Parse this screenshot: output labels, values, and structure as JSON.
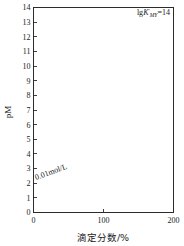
{
  "figure": {
    "name": "complexometric-titration-curves",
    "background_color": "#ffffff",
    "line_color": "#2b2b2b"
  },
  "axes": {
    "y_title": "pM",
    "x_title": "滴定分数/%",
    "y_ticks": [
      "0",
      "1",
      "2",
      "3",
      "4",
      "5",
      "6",
      "7",
      "8",
      "9",
      "10",
      "11",
      "12",
      "13",
      "14"
    ],
    "x_ticks": [
      "0",
      "100",
      "200"
    ],
    "x_minor_ticks": [
      "50",
      "150"
    ]
  },
  "annotations": {
    "top_label_prefix": "lg",
    "top_label_k": "K",
    "top_label_sub": "MY",
    "top_label_prime": "′",
    "top_label_value": "=14",
    "concentration": "0.01mol/L"
  },
  "curve_labels": [
    "12",
    "10",
    "9",
    "8",
    "7",
    "6",
    "5",
    "4",
    "3",
    "2"
  ],
  "chart_data": {
    "type": "line",
    "title": "",
    "xlabel": "滴定分数/%",
    "ylabel": "pM",
    "xlim": [
      0,
      200
    ],
    "ylim": [
      0,
      14
    ],
    "grid": false,
    "legend": "inline-right-end-labels",
    "x_ticks": [
      0,
      100,
      200
    ],
    "y_ticks": [
      0,
      1,
      2,
      3,
      4,
      5,
      6,
      7,
      8,
      9,
      10,
      11,
      12,
      13,
      14
    ],
    "annotation_concentration": "0.01mol/L",
    "annotation_parameter": "lgK'MY=14",
    "series": [
      {
        "name": "14",
        "lgK": 14,
        "x": [
          0,
          10,
          20,
          30,
          40,
          50,
          60,
          70,
          80,
          90,
          95,
          99,
          99.9,
          100,
          100.1,
          101,
          105,
          110,
          120,
          140,
          160,
          180,
          200
        ],
        "values": [
          2.0,
          2.05,
          2.1,
          2.15,
          2.22,
          2.3,
          2.4,
          2.52,
          2.7,
          3.0,
          3.3,
          4.0,
          5.0,
          8.0,
          9.7,
          10.7,
          11.7,
          12.1,
          12.6,
          13.2,
          13.5,
          13.7,
          13.8
        ]
      },
      {
        "name": "12",
        "lgK": 12,
        "x": [
          0,
          10,
          20,
          30,
          40,
          50,
          60,
          70,
          80,
          90,
          95,
          99,
          99.9,
          100,
          100.1,
          101,
          105,
          110,
          120,
          140,
          160,
          180,
          200
        ],
        "values": [
          2.0,
          2.05,
          2.1,
          2.15,
          2.22,
          2.3,
          2.4,
          2.52,
          2.7,
          3.0,
          3.3,
          4.0,
          4.9,
          7.0,
          7.7,
          8.7,
          9.7,
          10.1,
          10.6,
          11.2,
          11.5,
          11.8,
          12.05
        ]
      },
      {
        "name": "10",
        "lgK": 10,
        "x": [
          0,
          10,
          20,
          30,
          40,
          50,
          60,
          70,
          80,
          90,
          95,
          99,
          99.9,
          100,
          100.1,
          101,
          105,
          110,
          120,
          140,
          160,
          180,
          200
        ],
        "values": [
          2.0,
          2.05,
          2.1,
          2.15,
          2.22,
          2.3,
          2.4,
          2.52,
          2.7,
          3.0,
          3.25,
          3.85,
          4.5,
          6.0,
          6.2,
          6.9,
          7.7,
          8.1,
          8.6,
          9.2,
          9.5,
          9.8,
          10.0
        ]
      },
      {
        "name": "9",
        "lgK": 9,
        "x": [
          0,
          10,
          20,
          30,
          40,
          50,
          60,
          70,
          80,
          90,
          95,
          99,
          99.9,
          100,
          100.1,
          101,
          105,
          110,
          120,
          140,
          160,
          180,
          200
        ],
        "values": [
          2.0,
          2.05,
          2.1,
          2.15,
          2.22,
          2.3,
          2.4,
          2.52,
          2.68,
          2.95,
          3.2,
          3.7,
          4.3,
          5.5,
          5.6,
          6.1,
          6.9,
          7.25,
          7.7,
          8.3,
          8.6,
          8.85,
          9.0
        ]
      },
      {
        "name": "8",
        "lgK": 8,
        "x": [
          0,
          10,
          20,
          30,
          40,
          50,
          60,
          70,
          80,
          90,
          95,
          99,
          99.9,
          100,
          100.1,
          101,
          105,
          110,
          120,
          140,
          160,
          180,
          200
        ],
        "values": [
          2.0,
          2.05,
          2.1,
          2.15,
          2.22,
          2.3,
          2.4,
          2.5,
          2.65,
          2.9,
          3.1,
          3.55,
          4.1,
          5.0,
          5.05,
          5.4,
          6.1,
          6.4,
          6.85,
          7.4,
          7.7,
          7.9,
          8.05
        ]
      },
      {
        "name": "7",
        "lgK": 7,
        "x": [
          0,
          10,
          20,
          30,
          40,
          50,
          60,
          70,
          80,
          90,
          95,
          99,
          99.9,
          100,
          100.1,
          101,
          105,
          110,
          120,
          140,
          160,
          180,
          200
        ],
        "values": [
          2.0,
          2.05,
          2.1,
          2.15,
          2.2,
          2.28,
          2.38,
          2.48,
          2.6,
          2.82,
          3.0,
          3.35,
          3.8,
          4.5,
          4.55,
          4.8,
          5.3,
          5.6,
          6.0,
          6.5,
          6.75,
          6.95,
          7.05
        ]
      },
      {
        "name": "6",
        "lgK": 6,
        "x": [
          0,
          10,
          20,
          30,
          40,
          50,
          60,
          70,
          80,
          90,
          95,
          99,
          99.9,
          100,
          100.1,
          101,
          105,
          110,
          120,
          140,
          160,
          180,
          200
        ],
        "values": [
          2.0,
          2.05,
          2.08,
          2.13,
          2.18,
          2.25,
          2.33,
          2.43,
          2.55,
          2.72,
          2.88,
          3.15,
          3.5,
          4.0,
          4.02,
          4.2,
          4.6,
          4.85,
          5.2,
          5.6,
          5.85,
          6.0,
          6.1
        ]
      },
      {
        "name": "5",
        "lgK": 5,
        "x": [
          0,
          10,
          20,
          30,
          40,
          50,
          60,
          70,
          80,
          90,
          95,
          99,
          99.9,
          100,
          100.1,
          101,
          105,
          110,
          120,
          140,
          160,
          180,
          200
        ],
        "values": [
          2.0,
          2.04,
          2.07,
          2.11,
          2.15,
          2.2,
          2.27,
          2.35,
          2.45,
          2.6,
          2.72,
          2.95,
          3.2,
          3.5,
          3.52,
          3.65,
          3.92,
          4.1,
          4.35,
          4.7,
          4.9,
          5.05,
          5.15
        ]
      },
      {
        "name": "4",
        "lgK": 4,
        "x": [
          0,
          10,
          20,
          30,
          40,
          50,
          60,
          70,
          80,
          90,
          95,
          99,
          99.9,
          100,
          100.1,
          101,
          105,
          110,
          120,
          140,
          160,
          180,
          200
        ],
        "values": [
          2.0,
          2.03,
          2.06,
          2.09,
          2.13,
          2.17,
          2.22,
          2.28,
          2.36,
          2.47,
          2.56,
          2.72,
          2.9,
          3.05,
          3.06,
          3.15,
          3.32,
          3.45,
          3.62,
          3.88,
          4.05,
          4.18,
          4.28
        ]
      },
      {
        "name": "3",
        "lgK": 3,
        "x": [
          0,
          10,
          20,
          30,
          40,
          50,
          60,
          70,
          80,
          90,
          95,
          99,
          99.9,
          100,
          100.1,
          101,
          105,
          110,
          120,
          140,
          160,
          180,
          200
        ],
        "values": [
          2.0,
          2.02,
          2.05,
          2.07,
          2.1,
          2.13,
          2.17,
          2.22,
          2.28,
          2.36,
          2.42,
          2.53,
          2.63,
          2.7,
          2.71,
          2.77,
          2.88,
          2.97,
          3.1,
          3.3,
          3.45,
          3.58,
          3.68
        ]
      },
      {
        "name": "2",
        "lgK": 2,
        "x": [
          0,
          10,
          20,
          30,
          40,
          50,
          60,
          70,
          80,
          90,
          95,
          99,
          99.9,
          100,
          100.1,
          101,
          105,
          110,
          120,
          140,
          160,
          180,
          200
        ],
        "values": [
          2.0,
          2.02,
          2.04,
          2.06,
          2.08,
          2.11,
          2.14,
          2.17,
          2.21,
          2.26,
          2.3,
          2.36,
          2.41,
          2.44,
          2.44,
          2.48,
          2.55,
          2.6,
          2.68,
          2.8,
          2.9,
          2.98,
          3.05
        ]
      }
    ]
  }
}
